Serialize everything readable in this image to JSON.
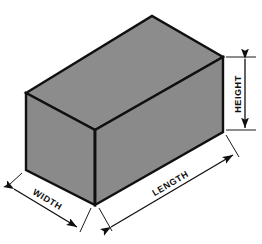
{
  "diagram": {
    "type": "isometric-technical-illustration",
    "background_color": "#ffffff",
    "outline_color": "#101010",
    "dimension_line_color": "#1a1a1a"
  },
  "solid": {
    "name": "rectangular-box",
    "faces": [
      {
        "id": "top",
        "label": "top-face",
        "fill": "#8c8c8c"
      },
      {
        "id": "front-left",
        "label": "left-front-face",
        "fill": "#8a8a8a"
      },
      {
        "id": "front-right",
        "label": "right-front-face",
        "fill": "#8a8a8a"
      }
    ]
  },
  "dimensions": [
    {
      "id": "height",
      "label": "HEIGHT",
      "orientation": "vertical",
      "text_rotation": -90,
      "arrow_style": "double-headed"
    },
    {
      "id": "length",
      "label": "LENGTH",
      "orientation": "diagonal-up-right",
      "text_rotation": -27,
      "arrow_style": "double-headed"
    },
    {
      "id": "width",
      "label": "WIDTH",
      "orientation": "diagonal-down-right",
      "text_rotation": 27,
      "arrow_style": "double-headed"
    }
  ]
}
